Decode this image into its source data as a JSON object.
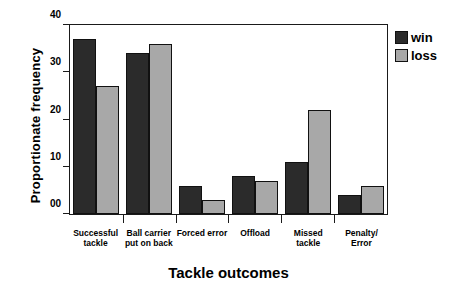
{
  "chart_data": {
    "type": "bar",
    "title": "",
    "xlabel": "Tackle outcomes",
    "ylabel": "Proportionate frequency",
    "categories": [
      "Successful tackle",
      "Ball carrier put on back",
      "Forced error",
      "Offload",
      "Missed tackle",
      "Penalty/ Error"
    ],
    "series": [
      {
        "name": "win",
        "color": "#2b2b2b",
        "values": [
          37,
          34,
          6,
          8,
          11,
          4
        ]
      },
      {
        "name": "loss",
        "color": "#a8a8a8",
        "values": [
          27,
          36,
          3,
          7,
          22,
          6
        ]
      }
    ],
    "ylim": [
      0,
      40
    ],
    "yticks": [
      "00",
      "10",
      "20",
      "30",
      "40"
    ],
    "ytick_values": [
      0,
      10,
      20,
      30,
      40
    ],
    "grid": false,
    "legend_position": "top-right"
  },
  "legend": {
    "items": [
      {
        "label": "win"
      },
      {
        "label": "loss"
      }
    ]
  }
}
